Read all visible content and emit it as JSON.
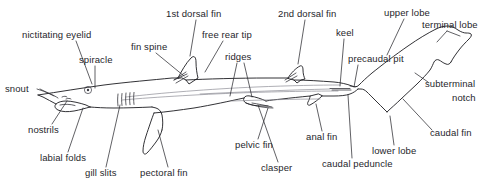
{
  "diagram": {
    "style": "line drawing with leader lines and text labels",
    "background_color": "#ffffff",
    "line_color": "#1b1b1f",
    "text_color": "#26262b",
    "labels": [
      {
        "id": "nictitating-eyelid",
        "text": "nictitating eyelid",
        "x": 22,
        "y": 30,
        "anchor": "start"
      },
      {
        "id": "snout",
        "text": "snout",
        "x": 5,
        "y": 84,
        "anchor": "start"
      },
      {
        "id": "spiracle",
        "text": "spiracle",
        "x": 79,
        "y": 55,
        "anchor": "start"
      },
      {
        "id": "fin-spine",
        "text": "fin spine",
        "x": 131,
        "y": 42,
        "anchor": "start"
      },
      {
        "id": "first-dorsal-fin",
        "text": "1st dorsal fin",
        "x": 166,
        "y": 9,
        "anchor": "start"
      },
      {
        "id": "free-rear-tip",
        "text": "free rear tip",
        "x": 202,
        "y": 30,
        "anchor": "start"
      },
      {
        "id": "ridges",
        "text": "ridges",
        "x": 225,
        "y": 52,
        "anchor": "start"
      },
      {
        "id": "second-dorsal-fin",
        "text": "2nd dorsal fin",
        "x": 278,
        "y": 9,
        "anchor": "start"
      },
      {
        "id": "keel",
        "text": "keel",
        "x": 336,
        "y": 28,
        "anchor": "start"
      },
      {
        "id": "precaudal-pit",
        "text": "precaudal pit",
        "x": 348,
        "y": 54,
        "anchor": "start"
      },
      {
        "id": "upper-lobe",
        "text": "upper lobe",
        "x": 384,
        "y": 8,
        "anchor": "start"
      },
      {
        "id": "terminal-lobe",
        "text": "terminal lobe",
        "x": 422,
        "y": 20,
        "anchor": "start"
      },
      {
        "id": "subterminal",
        "text": "subterminal",
        "x": 425,
        "y": 79,
        "anchor": "start"
      },
      {
        "id": "notch",
        "text": "notch",
        "x": 452,
        "y": 93,
        "anchor": "start"
      },
      {
        "id": "caudal-fin",
        "text": "caudal fin",
        "x": 430,
        "y": 128,
        "anchor": "start"
      },
      {
        "id": "lower-lobe",
        "text": "lower lobe",
        "x": 372,
        "y": 146,
        "anchor": "start"
      },
      {
        "id": "caudal-peduncle",
        "text": "caudal peduncle",
        "x": 322,
        "y": 159,
        "anchor": "start"
      },
      {
        "id": "anal-fin",
        "text": "anal fin",
        "x": 306,
        "y": 132,
        "anchor": "start"
      },
      {
        "id": "clasper",
        "text": "clasper",
        "x": 261,
        "y": 163,
        "anchor": "start"
      },
      {
        "id": "pelvic-fin",
        "text": "pelvic fin",
        "x": 235,
        "y": 140,
        "anchor": "start"
      },
      {
        "id": "pectoral-fin",
        "text": "pectoral fin",
        "x": 140,
        "y": 168,
        "anchor": "start"
      },
      {
        "id": "gill-slits",
        "text": "gill slits",
        "x": 85,
        "y": 168,
        "anchor": "start"
      },
      {
        "id": "labial-folds",
        "text": "labial folds",
        "x": 40,
        "y": 153,
        "anchor": "start"
      },
      {
        "id": "nostrils",
        "text": "nostrils",
        "x": 28,
        "y": 125,
        "anchor": "start"
      }
    ]
  }
}
